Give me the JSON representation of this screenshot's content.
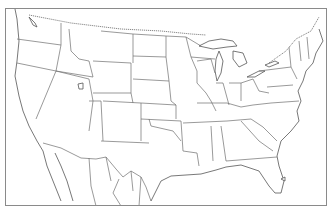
{
  "map": {
    "type": "blank outline map",
    "region": "Contiguous United States with southern Canada and northern Mexico",
    "labels": [],
    "colors": {
      "background": "#ffffff",
      "border": "#6e6e6e",
      "frame": "#8a8a8a"
    }
  }
}
